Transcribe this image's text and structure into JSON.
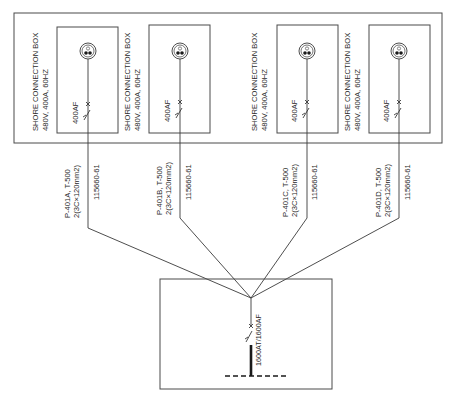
{
  "diagram": {
    "type": "single-line electrical diagram",
    "outer_box_label": "",
    "shore_boxes": [
      {
        "title": "SHORE CONNECTION BOX",
        "rating": "480V, 400A, 60HZ",
        "breaker": "400AF",
        "cable_id": "P-401A, T-500",
        "cable_spec": "2(3C×120mm2)",
        "drawing_ref": "115660-61"
      },
      {
        "title": "SHORE CONNECTION BOX",
        "rating": "480V, 400A, 60HZ",
        "breaker": "400AF",
        "cable_id": "P-401B, T-500",
        "cable_spec": "2(3C×120mm2)",
        "drawing_ref": "115660-61"
      },
      {
        "title": "SHORE CONNECTION BOX",
        "rating": "480V, 400A, 60HZ",
        "breaker": "400AF",
        "cable_id": "P-401C, T-500",
        "cable_spec": "2(3C×120mm2)",
        "drawing_ref": "115660-61"
      },
      {
        "title": "SHORE CONNECTION BOX",
        "rating": "480V, 400A, 60HZ",
        "breaker": "400AF",
        "cable_id": "P-401D, T-500",
        "cable_spec": "2(3C×120mm2)",
        "drawing_ref": "115660-61"
      }
    ],
    "main_breaker": "1600AT/1600AF",
    "colors": {
      "line": "#3a3a3a",
      "text": "#2a2a2a",
      "background": "#ffffff"
    }
  }
}
